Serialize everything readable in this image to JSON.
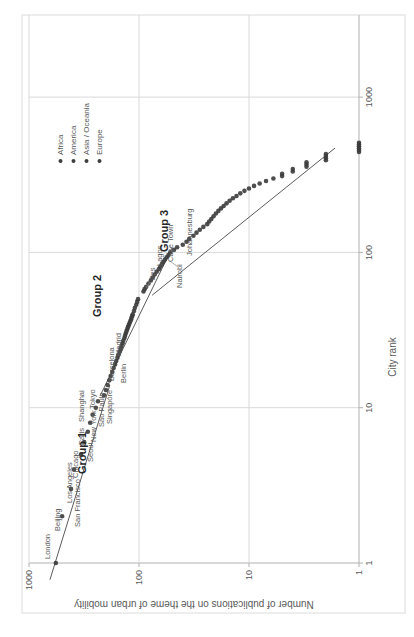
{
  "page": {
    "background": "#ffffff"
  },
  "chart_data": {
    "type": "scatter",
    "title": "",
    "xlabel": "City rank",
    "ylabel": "Number of publications on the theme of urban mobility",
    "x_scale": "log",
    "y_scale": "log",
    "x_ticks": [
      1,
      10,
      100,
      1000
    ],
    "y_ticks": [
      1,
      10,
      100,
      1000
    ],
    "xlim": [
      1,
      3000
    ],
    "ylim": [
      1,
      1000
    ],
    "grid": true,
    "colors": {
      "gridline": "#d9d9d9",
      "axis": "#b0b0b0",
      "tick_text": "#595959",
      "axis_title": "#595959",
      "city_label": "#595959",
      "group_label": "#262626",
      "trend_line": "#4a4a4a",
      "leader": "#8a8a8a",
      "border": "#dcdcdc"
    },
    "marker": {
      "color": "#3b3b3b",
      "radius": 2.3,
      "opacity": 0.9
    },
    "legend": {
      "position": "top-right",
      "entries": [
        {
          "label": "Africa",
          "color": "#3d3d3d"
        },
        {
          "label": "America",
          "color": "#3d3d3d"
        },
        {
          "label": "Asia / Oceania",
          "color": "#3d3d3d"
        },
        {
          "label": "Europe",
          "color": "#3d3d3d"
        }
      ]
    },
    "group_labels": [
      {
        "text": "Group 1",
        "x": 163,
        "y": 86
      },
      {
        "text": "Group 2",
        "x": 320,
        "y": 101
      },
      {
        "text": "Group 3",
        "x": 385,
        "y": 168
      }
    ],
    "trend_lines": [
      {
        "from": [
          0.78,
          645
        ],
        "to": [
          14,
          184
        ]
      },
      {
        "from": [
          11.9,
          226
        ],
        "to": [
          107,
          50
        ]
      },
      {
        "from": [
          53,
          76
        ],
        "to": [
          470,
          1.65
        ]
      }
    ],
    "labeled_cities": [
      {
        "city": "London",
        "continent": "Europe",
        "rank": 1,
        "pubs": 570,
        "lx": 78,
        "ly": 50
      },
      {
        "city": "Beijing",
        "continent": "Asia",
        "rank": 2,
        "pubs": 500,
        "lx": 106,
        "ly": 60
      },
      {
        "city": "San Francisco",
        "continent": "America",
        "rank": 3,
        "pubs": 415,
        "lx": 110,
        "ly": 80
      },
      {
        "city": "Los Angeles",
        "continent": "America",
        "rank": 4,
        "pubs": 390,
        "lx": 134,
        "ly": 72
      },
      {
        "city": "Chicago",
        "continent": "America",
        "rank": 5,
        "pubs": 337,
        "lx": 159,
        "ly": 78
      },
      {
        "city": "Seoul",
        "continent": "Asia",
        "rank": 6,
        "pubs": 315,
        "lx": 175,
        "ly": 93
      },
      {
        "city": "New York",
        "continent": "America",
        "rank": 7,
        "pubs": 292,
        "lx": 195,
        "ly": 96
      },
      {
        "city": "Paris",
        "continent": "Europe",
        "rank": 8,
        "pubs": 278,
        "lx": 192,
        "ly": 84
      },
      {
        "city": "Shanghai",
        "continent": "Asia",
        "rank": 9,
        "pubs": 264,
        "lx": 215,
        "ly": 84
      },
      {
        "city": "Sao Paulo",
        "continent": "America",
        "rank": 10,
        "pubs": 247,
        "lx": 210,
        "ly": 104
      },
      {
        "city": "Tokyo",
        "continent": "Asia",
        "rank": 11,
        "pubs": 236,
        "lx": 228,
        "ly": 95
      },
      {
        "city": "Singapore",
        "continent": "Asia",
        "rank": 12,
        "pubs": 208,
        "lx": 213,
        "ly": 112,
        "leader": [
          238,
          108,
          241,
          105
        ]
      },
      {
        "city": "Barcelona",
        "continent": "Europe",
        "rank": 13,
        "pubs": 200,
        "lx": 256,
        "ly": 114
      },
      {
        "city": "Madrid",
        "continent": "Europe",
        "rank": 14,
        "pubs": 193,
        "lx": 281,
        "ly": 121
      },
      {
        "city": "Berlin",
        "continent": "Europe",
        "rank": 16,
        "pubs": 181,
        "lx": 254,
        "ly": 126
      },
      {
        "city": "Fes",
        "continent": "Africa",
        "rank": 58,
        "pubs": 89,
        "lx": 357,
        "ly": 155,
        "leader": [
          355,
          150,
          349,
          146
        ]
      },
      {
        "city": "Lagos",
        "continent": "Africa",
        "rank": 72,
        "pubs": 72,
        "lx": 371,
        "ly": 162
      },
      {
        "city": "Cape Town",
        "continent": "Africa",
        "rank": 84,
        "pubs": 62,
        "lx": 375,
        "ly": 173
      },
      {
        "city": "Nairobi",
        "continent": "Africa",
        "rank": 93,
        "pubs": 56,
        "lx": 349,
        "ly": 182,
        "leader": [
          370,
          178,
          376,
          170
        ]
      },
      {
        "city": "Johannesburg",
        "continent": "Africa",
        "rank": 112,
        "pubs": 40,
        "lx": 381,
        "ly": 192
      }
    ],
    "points": [
      [
        1,
        570
      ],
      [
        2,
        500
      ],
      [
        3,
        415
      ],
      [
        4,
        390
      ],
      [
        5,
        337
      ],
      [
        6,
        315
      ],
      [
        7,
        292
      ],
      [
        8,
        278
      ],
      [
        9,
        264
      ],
      [
        10,
        247
      ],
      [
        11,
        236
      ],
      [
        12,
        208
      ],
      [
        13,
        200
      ],
      [
        14,
        193
      ],
      [
        15,
        186
      ],
      [
        16,
        181
      ],
      [
        17,
        175
      ],
      [
        18,
        170
      ],
      [
        19,
        165
      ],
      [
        20,
        161
      ],
      [
        21,
        157
      ],
      [
        22,
        154
      ],
      [
        23,
        150
      ],
      [
        24,
        147
      ],
      [
        25,
        144
      ],
      [
        26,
        141
      ],
      [
        27,
        139
      ],
      [
        28,
        136
      ],
      [
        29,
        134
      ],
      [
        30,
        132
      ],
      [
        31,
        130
      ],
      [
        32,
        128
      ],
      [
        33,
        126
      ],
      [
        34,
        124
      ],
      [
        35,
        122
      ],
      [
        36,
        120
      ],
      [
        37,
        118
      ],
      [
        38,
        117
      ],
      [
        39,
        115
      ],
      [
        40,
        114
      ],
      [
        42,
        111
      ],
      [
        44,
        109
      ],
      [
        46,
        106
      ],
      [
        48,
        104
      ],
      [
        50,
        102
      ],
      [
        56,
        91
      ],
      [
        58,
        89
      ],
      [
        60,
        86
      ],
      [
        63,
        82
      ],
      [
        66,
        78
      ],
      [
        69,
        75
      ],
      [
        72,
        72
      ],
      [
        75,
        69
      ],
      [
        78,
        66
      ],
      [
        81,
        64
      ],
      [
        84,
        62
      ],
      [
        87,
        60
      ],
      [
        90,
        58
      ],
      [
        93,
        56
      ],
      [
        96,
        54
      ],
      [
        100,
        52
      ],
      [
        104,
        48
      ],
      [
        108,
        45
      ],
      [
        112,
        40
      ],
      [
        117,
        37
      ],
      [
        122,
        35
      ],
      [
        128,
        32
      ],
      [
        134,
        30
      ],
      [
        140,
        28
      ],
      [
        146,
        26
      ],
      [
        152,
        24
      ],
      [
        158,
        23
      ],
      [
        164,
        22
      ],
      [
        171,
        21
      ],
      [
        178,
        20
      ],
      [
        185,
        19
      ],
      [
        192,
        18
      ],
      [
        199,
        17
      ],
      [
        207,
        16
      ],
      [
        215,
        15
      ],
      [
        223,
        14
      ],
      [
        231,
        13
      ],
      [
        240,
        12
      ],
      [
        249,
        11
      ],
      [
        258,
        10
      ],
      [
        268,
        9
      ],
      [
        278,
        8
      ],
      [
        288,
        7
      ],
      [
        299,
        6
      ],
      [
        310,
        5
      ],
      [
        321,
        5
      ],
      [
        332,
        4
      ],
      [
        344,
        4
      ],
      [
        356,
        3
      ],
      [
        368,
        3
      ],
      [
        380,
        3
      ],
      [
        392,
        2
      ],
      [
        404,
        2
      ],
      [
        417,
        2
      ],
      [
        430,
        2
      ],
      [
        443,
        1
      ],
      [
        456,
        1
      ],
      [
        469,
        1
      ],
      [
        482,
        1
      ],
      [
        495,
        1
      ],
      [
        508,
        1
      ]
    ]
  }
}
